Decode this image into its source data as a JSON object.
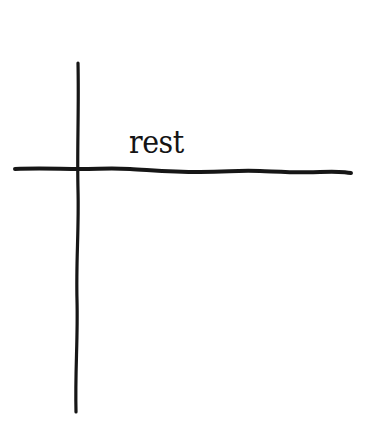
{
  "diagram": {
    "type": "cross-axes",
    "label": "rest",
    "stroke_color": "#161616",
    "background_color": "#ffffff",
    "vertical_line": {
      "x_top": 78,
      "y_top": 63,
      "x_bottom": 76,
      "y_bottom": 412
    },
    "horizontal_line": {
      "x_left": 15,
      "y_left": 169,
      "x_right": 351,
      "y_right": 173
    }
  }
}
